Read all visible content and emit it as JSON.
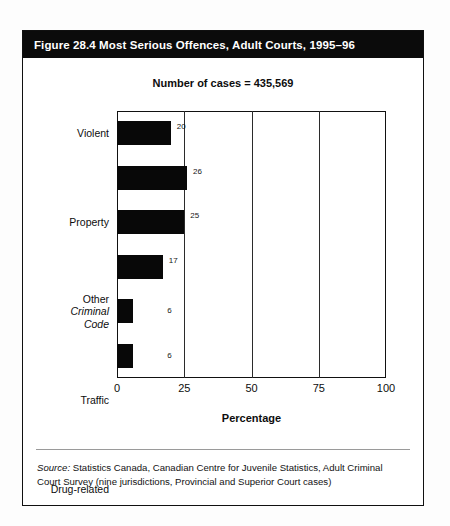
{
  "figure": {
    "title": "Figure 28.4  Most Serious Offences, Adult Courts, 1995–96",
    "subtitle": "Number of cases = 435,569",
    "source_label": "Source:",
    "source_text": " Statistics Canada, Canadian Centre for Juvenile Statistics, Adult Criminal Court Survey (nine jurisdictions, Provincial and Superior Court cases)"
  },
  "colors": {
    "title_bar_background": "#0b0b0b",
    "title_text": "#ffffff",
    "bar_fill": "#080808",
    "plot_border": "#111111",
    "gridline": "#2b2b2b",
    "card_border": "#101010",
    "page_background": "#fdfdfd",
    "source_rule": "#9a9a9a"
  },
  "chart_data": {
    "type": "bar",
    "orientation": "horizontal",
    "title": "Number of cases = 435,569",
    "xlabel": "Percentage",
    "ylabel": "",
    "xlim": [
      0,
      100
    ],
    "xticks": [
      0,
      25,
      50,
      75,
      100
    ],
    "xtick_labels": [
      "0",
      "25",
      "50",
      "75",
      "100"
    ],
    "gridlines_x": [
      25,
      50,
      75
    ],
    "grid": true,
    "legend": false,
    "categories": [
      "Violent",
      "Property",
      "Other Criminal Code",
      "Traffic",
      "Drug-related",
      "Other Federal Status"
    ],
    "category_labels": [
      {
        "lines": [
          {
            "text": "Violent",
            "italic": false
          }
        ]
      },
      {
        "lines": [
          {
            "text": "Property",
            "italic": false
          }
        ]
      },
      {
        "lines": [
          {
            "text": "Other",
            "italic": false
          },
          {
            "text": "Criminal",
            "italic": true
          },
          {
            "text": "Code",
            "italic": true
          }
        ]
      },
      {
        "lines": [
          {
            "text": "Traffic",
            "italic": false
          }
        ]
      },
      {
        "lines": [
          {
            "text": "Drug-related",
            "italic": false
          }
        ]
      },
      {
        "lines": [
          {
            "text": "Other Federal",
            "italic": false
          },
          {
            "text": "Status",
            "italic": false
          }
        ]
      }
    ],
    "values": [
      20,
      26,
      25,
      17,
      6,
      6
    ],
    "value_labels": [
      "20",
      "26",
      "25",
      "17",
      "6",
      "6"
    ],
    "units": "percent"
  }
}
